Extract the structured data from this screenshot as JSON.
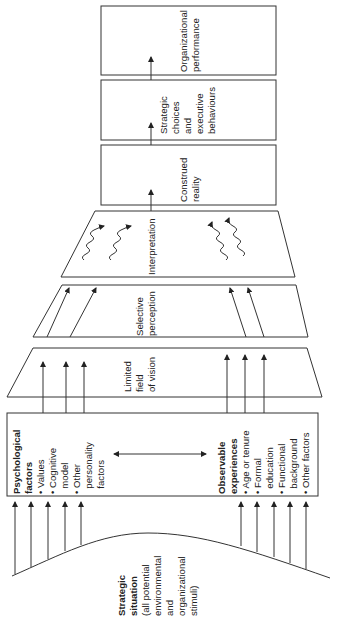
{
  "diagram": {
    "orientation": "rotated 90 degrees counter-clockwise",
    "stages": [
      {
        "id": "organizational_performance",
        "lines": [
          "Organizational",
          "performance"
        ]
      },
      {
        "id": "strategic_choices",
        "lines": [
          "Strategic",
          "choices",
          "and",
          "executive",
          "behaviours"
        ]
      },
      {
        "id": "construed_reality",
        "lines": [
          "Construed",
          "reality"
        ]
      },
      {
        "id": "interpretation",
        "lines": [
          "Interpretation"
        ]
      },
      {
        "id": "selective_perception",
        "lines": [
          "Selective",
          "perception"
        ]
      },
      {
        "id": "limited_field",
        "lines": [
          "Limited",
          "field",
          "of vision"
        ]
      }
    ],
    "psychological": {
      "title_lines": [
        "Psychological",
        "factors"
      ],
      "items": [
        "Values",
        "Cognitive",
        "model",
        "Other",
        "personality",
        "factors"
      ],
      "bullets": [
        true,
        true,
        false,
        true,
        false,
        false
      ]
    },
    "observable": {
      "title_lines": [
        "Observable",
        "experiences"
      ],
      "items": [
        "Age or tenure",
        "Formal",
        "education",
        "Functional",
        "background",
        "Other factors"
      ],
      "bullets": [
        true,
        true,
        false,
        true,
        false,
        true
      ]
    },
    "situation": {
      "title_lines": [
        "Strategic",
        "situation"
      ],
      "desc_lines": [
        "(all potential",
        "environmental",
        "and",
        "organizational",
        "stimuli)"
      ]
    },
    "bullet_char": "•"
  }
}
